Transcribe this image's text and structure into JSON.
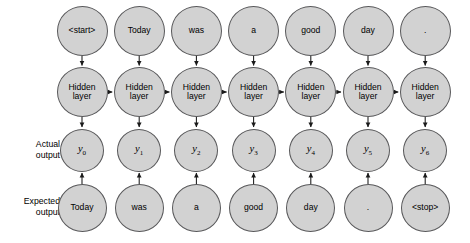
{
  "diagram": {
    "type": "rnn-unrolled",
    "timesteps": 7,
    "colors": {
      "node_fill": "#d2d2d2",
      "node_stroke": "#58585a",
      "arrow": "#1a1a1a",
      "background": "#ffffff",
      "text": "#000000"
    },
    "row_labels": {
      "actual_output": {
        "line1": "Actual",
        "line2": "output"
      },
      "expected_output": {
        "line1": "Expected",
        "line2": "output"
      }
    },
    "rows": {
      "input": {
        "name": "input",
        "nodes": [
          {
            "label": "<start>"
          },
          {
            "label": "Today"
          },
          {
            "label": "was"
          },
          {
            "label": "a"
          },
          {
            "label": "good"
          },
          {
            "label": "day"
          },
          {
            "label": "."
          }
        ]
      },
      "hidden": {
        "name": "hidden-layer",
        "nodes": [
          {
            "line1": "Hidden",
            "line2": "layer"
          },
          {
            "line1": "Hidden",
            "line2": "layer"
          },
          {
            "line1": "Hidden",
            "line2": "layer"
          },
          {
            "line1": "Hidden",
            "line2": "layer"
          },
          {
            "line1": "Hidden",
            "line2": "layer"
          },
          {
            "line1": "Hidden",
            "line2": "layer"
          },
          {
            "line1": "Hidden",
            "line2": "layer"
          }
        ]
      },
      "actual": {
        "name": "actual-output",
        "nodes": [
          {
            "symbol": "y",
            "subscript": "0"
          },
          {
            "symbol": "y",
            "subscript": "1"
          },
          {
            "symbol": "y",
            "subscript": "2"
          },
          {
            "symbol": "y",
            "subscript": "3"
          },
          {
            "symbol": "y",
            "subscript": "4"
          },
          {
            "symbol": "y",
            "subscript": "5"
          },
          {
            "symbol": "y",
            "subscript": "6"
          }
        ]
      },
      "expected": {
        "name": "expected-output",
        "nodes": [
          {
            "label": "Today"
          },
          {
            "label": "was"
          },
          {
            "label": "a"
          },
          {
            "label": "good"
          },
          {
            "label": "day"
          },
          {
            "label": "."
          },
          {
            "label": "<stop>"
          }
        ]
      }
    },
    "edges": {
      "input_to_hidden": "down-arrow",
      "hidden_to_hidden": "right-arrow",
      "hidden_to_actual": "down-arrow",
      "expected_to_actual": "up-arrow"
    }
  }
}
